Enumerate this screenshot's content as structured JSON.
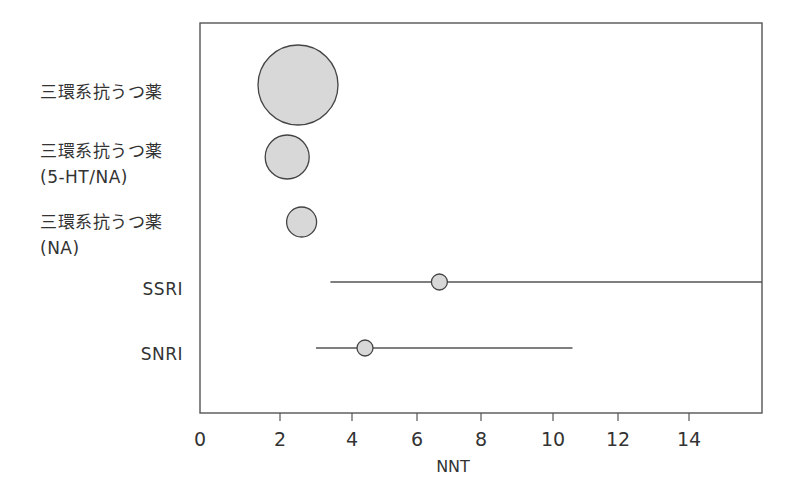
{
  "chart_data": {
    "type": "scatter",
    "subtype": "forest-plot-bubble",
    "title": "",
    "xlabel": "NNT",
    "ylabel": "",
    "xlim": [
      0,
      16
    ],
    "x_ticks": [
      0,
      2,
      4,
      6,
      8,
      10,
      12,
      14
    ],
    "x_tick_labels": [
      "0",
      "2",
      "4",
      "6",
      "8",
      "10",
      "12",
      "14"
    ],
    "grid": false,
    "legend": null,
    "categories": [
      [
        "三環系抗うつ薬"
      ],
      [
        "三環系抗うつ薬",
        "(5-HT/NA)"
      ],
      [
        "三環系抗うつ薬",
        "(NA)"
      ],
      [
        "SSRI"
      ],
      [
        "SNRI"
      ]
    ],
    "series": [
      {
        "name": "NNT",
        "points": [
          {
            "category": "三環系抗うつ薬",
            "nnt": 2.5,
            "ci_low": null,
            "ci_high": null,
            "marker_radius_px": 40
          },
          {
            "category": "三環系抗うつ薬 (5-HT/NA)",
            "nnt": 2.2,
            "ci_low": null,
            "ci_high": null,
            "marker_radius_px": 22
          },
          {
            "category": "三環系抗うつ薬 (NA)",
            "nnt": 2.6,
            "ci_low": null,
            "ci_high": null,
            "marker_radius_px": 15
          },
          {
            "category": "SSRI",
            "nnt": 6.7,
            "ci_low": 3.4,
            "ci_high": 16,
            "ci_high_clipped": true,
            "marker_radius_px": 8
          },
          {
            "category": "SNRI",
            "nnt": 4.4,
            "ci_low": 3.0,
            "ci_high": 10.6,
            "marker_radius_px": 8
          }
        ]
      }
    ]
  },
  "colors": {
    "marker_fill": "#d8d8d8",
    "marker_stroke": "#444444",
    "ci_line": "#555555",
    "frame": "#555555",
    "text": "#333333"
  },
  "layout": {
    "frame": {
      "left": 200,
      "top": 23,
      "right": 762,
      "bottom": 413
    },
    "tick_px": {
      "0": 200,
      "2": 280,
      "4": 352,
      "6": 417,
      "8": 481,
      "10": 553,
      "12": 618,
      "14": 689,
      "16": 762
    },
    "row_y": [
      85,
      157,
      222,
      282,
      348
    ]
  },
  "labels": {
    "row0": {
      "l1": "三環系抗うつ薬"
    },
    "row1": {
      "l1": "三環系抗うつ薬",
      "l2": "(5-HT/NA)"
    },
    "row2": {
      "l1": "三環系抗うつ薬",
      "l2": "(NA)"
    },
    "row3": {
      "l1": "SSRI"
    },
    "row4": {
      "l1": "SNRI"
    },
    "ticks": [
      "0",
      "2",
      "4",
      "6",
      "8",
      "10",
      "12",
      "14"
    ],
    "xlabel": "NNT"
  }
}
